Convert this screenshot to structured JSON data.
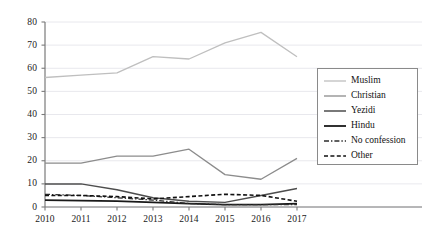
{
  "chart_data": {
    "type": "line",
    "title": "",
    "subtitle": "",
    "xlabel": "",
    "ylabel": "",
    "categories": [
      "2010",
      "2011",
      "2012",
      "2013",
      "2014",
      "2015",
      "2016",
      "2017"
    ],
    "x": [
      2010,
      2011,
      2012,
      2013,
      2014,
      2015,
      2016,
      2017
    ],
    "xlim": [
      2010,
      2017
    ],
    "ylim": [
      0,
      80
    ],
    "yticks": [
      0,
      10,
      20,
      30,
      40,
      50,
      60,
      70,
      80
    ],
    "xticks": [
      "2010",
      "2011",
      "2012",
      "2013",
      "2014",
      "2015",
      "2016",
      "2017"
    ],
    "grid": "horizontal",
    "legend_position": "right",
    "series": [
      {
        "name": "Muslim",
        "values": [
          56,
          57,
          58,
          65,
          64,
          71,
          75.5,
          65
        ],
        "color": "#bfbfbf",
        "style": "solid",
        "width": 1.3
      },
      {
        "name": "Christian",
        "values": [
          19,
          19,
          22,
          22,
          25,
          14,
          12,
          21
        ],
        "color": "#8c8c8c",
        "style": "solid",
        "width": 1.3
      },
      {
        "name": "Yezidi",
        "values": [
          10,
          10,
          7.5,
          4,
          2.5,
          2,
          5,
          8
        ],
        "color": "#4d4d4d",
        "style": "solid",
        "width": 1.5
      },
      {
        "name": "Hindu",
        "values": [
          3,
          2.8,
          2.5,
          2,
          1.5,
          1,
          1,
          1.5
        ],
        "color": "#1a1a1a",
        "style": "solid",
        "width": 1.8
      },
      {
        "name": "No confession",
        "values": [
          5.5,
          5,
          4,
          3,
          1.5,
          1,
          1,
          1
        ],
        "color": "#2b2b2b",
        "style": "dashdot",
        "width": 1.2
      },
      {
        "name": "Other",
        "values": [
          5,
          5,
          4.5,
          3.5,
          4.5,
          5.5,
          5,
          2.5
        ],
        "color": "#111111",
        "style": "dashed",
        "width": 1.6
      }
    ]
  },
  "legend": {
    "entries": [
      {
        "label": "Muslim"
      },
      {
        "label": "Christian"
      },
      {
        "label": "Yezidi"
      },
      {
        "label": "Hindu"
      },
      {
        "label": "No confession"
      },
      {
        "label": "Other"
      }
    ]
  },
  "axes": {
    "y_labels": [
      "80",
      "70",
      "60",
      "50",
      "40",
      "30",
      "20",
      "10",
      "0"
    ],
    "x_labels": [
      "2010",
      "2011",
      "2012",
      "2013",
      "2014",
      "2015",
      "2016",
      "2017"
    ]
  },
  "colors": {
    "axis": "#7a7a7a",
    "grid": "#e2e2e8",
    "text": "#1a1a1a",
    "legend_border": "#8a8a8a",
    "background": "#ffffff"
  }
}
